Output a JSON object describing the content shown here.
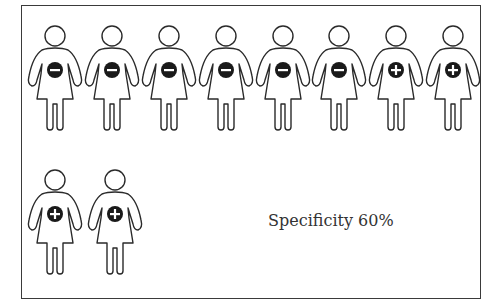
{
  "figure": {
    "caption": "Specificity 60%",
    "total_people": 10,
    "negative_count": 6,
    "positive_count": 4,
    "icon_fill": "#1a1a1a",
    "outline_color": "#2a2a2a"
  },
  "people": [
    {
      "row": 1,
      "index": 1,
      "sign": "−",
      "result": "negative"
    },
    {
      "row": 1,
      "index": 2,
      "sign": "−",
      "result": "negative"
    },
    {
      "row": 1,
      "index": 3,
      "sign": "−",
      "result": "negative"
    },
    {
      "row": 1,
      "index": 4,
      "sign": "−",
      "result": "negative"
    },
    {
      "row": 1,
      "index": 5,
      "sign": "−",
      "result": "negative"
    },
    {
      "row": 1,
      "index": 6,
      "sign": "−",
      "result": "negative"
    },
    {
      "row": 1,
      "index": 7,
      "sign": "+",
      "result": "positive"
    },
    {
      "row": 1,
      "index": 8,
      "sign": "+",
      "result": "positive"
    },
    {
      "row": 2,
      "index": 1,
      "sign": "+",
      "result": "positive"
    },
    {
      "row": 2,
      "index": 2,
      "sign": "+",
      "result": "positive"
    }
  ]
}
